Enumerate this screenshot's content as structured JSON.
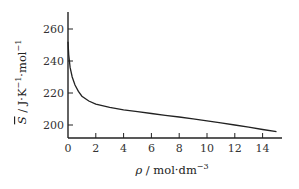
{
  "chart_data": {
    "type": "line",
    "title": "",
    "xlabel": "ρ / mol·dm⁻³",
    "ylabel": "S̄ / J·K⁻¹·mol⁻¹",
    "xlim": [
      0,
      15.2
    ],
    "ylim": [
      192,
      272
    ],
    "x_ticks": [
      0,
      2,
      4,
      6,
      8,
      10,
      12,
      14
    ],
    "y_ticks": [
      200,
      220,
      240,
      260
    ],
    "grid": false,
    "legend": null,
    "series": [
      {
        "name": "molar entropy vs density",
        "x": [
          0,
          0.05,
          0.15,
          0.3,
          0.5,
          0.75,
          1,
          1.5,
          2,
          3,
          4,
          5,
          6,
          7,
          8,
          9,
          10,
          11,
          12,
          13,
          14,
          15
        ],
        "y": [
          252,
          244,
          236,
          230,
          225,
          221,
          218,
          215,
          213,
          211,
          209.5,
          208.3,
          207.2,
          206,
          205,
          203.8,
          202.6,
          201.3,
          200,
          198.6,
          197.2,
          195.8
        ]
      }
    ]
  },
  "axes": {
    "x_title_symbol": "ρ",
    "x_title_unit": " / mol·dm",
    "x_title_exp": "−3",
    "y_title_symbol": "S",
    "y_title_unit": " / J·K",
    "y_title_exp1": "−1",
    "y_title_mid": "·mol",
    "y_title_exp2": "−1"
  }
}
